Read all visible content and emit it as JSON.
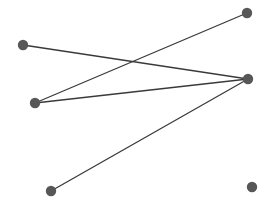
{
  "canvas": {
    "width": 269,
    "height": 214,
    "background_color": "#ffffff"
  },
  "style": {
    "node_color": "#575757",
    "node_radius": 5.2,
    "edge_color": "#3a3a3a",
    "edge_width": 1.3
  },
  "chart_data": {
    "type": "scatter",
    "title": "",
    "subtitle": "",
    "xlabel": "",
    "ylabel": "",
    "grid": false,
    "legend": "none",
    "xlim": [
      0,
      269
    ],
    "ylim": [
      0,
      214
    ],
    "node_count": 6,
    "edge_count": 4,
    "nodes": [
      {
        "id": "n1",
        "label": "",
        "x": 23,
        "y": 45,
        "degree": 1
      },
      {
        "id": "n2",
        "label": "",
        "x": 35,
        "y": 103,
        "degree": 2
      },
      {
        "id": "n3",
        "label": "",
        "x": 51,
        "y": 191,
        "degree": 1
      },
      {
        "id": "n4",
        "label": "",
        "x": 247,
        "y": 13,
        "degree": 1
      },
      {
        "id": "n5",
        "label": "",
        "x": 248,
        "y": 79,
        "degree": 3
      },
      {
        "id": "n6",
        "label": "",
        "x": 252,
        "y": 187,
        "degree": 0
      }
    ],
    "edges": [
      {
        "id": "e1",
        "source": "n1",
        "target": "n5",
        "x1": 23,
        "y1": 45,
        "x2": 248,
        "y2": 79
      },
      {
        "id": "e2",
        "source": "n2",
        "target": "n4",
        "x1": 35,
        "y1": 103,
        "x2": 247,
        "y2": 13
      },
      {
        "id": "e3",
        "source": "n2",
        "target": "n5",
        "x1": 35,
        "y1": 103,
        "x2": 248,
        "y2": 79
      },
      {
        "id": "e4",
        "source": "n3",
        "target": "n5",
        "x1": 51,
        "y1": 191,
        "x2": 248,
        "y2": 79
      }
    ]
  }
}
